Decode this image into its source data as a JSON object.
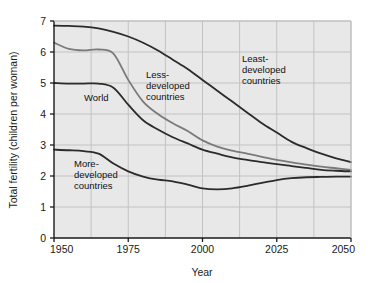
{
  "chart_data": {
    "type": "line",
    "title": "",
    "xlabel": "Year",
    "ylabel": "Total fertility (children per woman)",
    "xlim": [
      1950,
      2050
    ],
    "ylim": [
      0,
      7
    ],
    "xticks": [
      "1950",
      "1975",
      "2000",
      "2025",
      "2050"
    ],
    "xtick_values": [
      1950,
      1975,
      2000,
      2025,
      2050
    ],
    "yticks": [
      "0",
      "1",
      "2",
      "3",
      "4",
      "5",
      "6",
      "7"
    ],
    "ytick_values": [
      0,
      1,
      2,
      3,
      4,
      5,
      6,
      7
    ],
    "grid": true,
    "grid_minor_x_step": 12.5,
    "legend_position": "inline-annotations",
    "x": [
      1950,
      1955,
      1960,
      1965,
      1970,
      1975,
      1980,
      1985,
      1990,
      1995,
      2000,
      2005,
      2010,
      2015,
      2020,
      2025,
      2030,
      2035,
      2040,
      2045,
      2050
    ],
    "series": [
      {
        "name": "Least-developed countries",
        "label": "Least-\ndeveloped\ncountries",
        "color": "#2b2b2b",
        "values": [
          6.85,
          6.84,
          6.82,
          6.76,
          6.65,
          6.5,
          6.3,
          6.05,
          5.75,
          5.45,
          5.1,
          4.75,
          4.4,
          4.05,
          3.7,
          3.4,
          3.1,
          2.9,
          2.72,
          2.57,
          2.45
        ]
      },
      {
        "name": "Less-developed countries",
        "label": "Less-\ndeveloped\ncountries",
        "color": "#7a7a7a",
        "values": [
          6.3,
          6.1,
          6.05,
          6.08,
          5.95,
          5.1,
          4.4,
          4.0,
          3.7,
          3.45,
          3.15,
          2.95,
          2.82,
          2.72,
          2.62,
          2.52,
          2.44,
          2.37,
          2.3,
          2.25,
          2.2
        ]
      },
      {
        "name": "World",
        "label": "World",
        "color": "#2b2b2b",
        "values": [
          5.0,
          4.98,
          4.98,
          4.98,
          4.85,
          4.3,
          3.8,
          3.5,
          3.25,
          3.05,
          2.85,
          2.72,
          2.6,
          2.52,
          2.45,
          2.38,
          2.32,
          2.26,
          2.2,
          2.17,
          2.15
        ]
      },
      {
        "name": "More-developed countries",
        "label": "More-\ndeveloped\ncountries",
        "color": "#2b2b2b",
        "values": [
          2.85,
          2.83,
          2.8,
          2.72,
          2.4,
          2.15,
          1.98,
          1.88,
          1.83,
          1.72,
          1.6,
          1.57,
          1.6,
          1.68,
          1.78,
          1.87,
          1.93,
          1.96,
          1.97,
          1.98,
          1.98
        ]
      }
    ]
  },
  "style": {
    "plot_background": "#e8e8e8",
    "grid_color": "#c2c2c2",
    "axis_color": "#1a1a1a",
    "page_background": "#ffffff"
  }
}
